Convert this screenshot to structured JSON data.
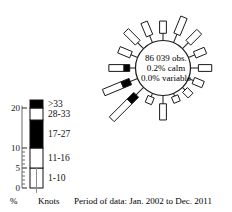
{
  "chart_data": {
    "type": "windrose",
    "title": "",
    "center_text": {
      "observations": "86 039 obs.",
      "calm": "0.2% calm",
      "variable": "0.0% variable"
    },
    "caption": "Period of data: Jan. 2002 to Dec. 2011",
    "axis": {
      "ylabel": "%",
      "ylim": [
        0,
        22
      ],
      "major_ticks": [
        0,
        5,
        10,
        20
      ],
      "major_tick_labels": [
        "0",
        "5",
        "10",
        "20"
      ],
      "minor_ticks": [
        1,
        2,
        3,
        4,
        6,
        7,
        8,
        9
      ]
    },
    "legend": {
      "units_label": "Knots",
      "bins": [
        {
          "label": "1-10",
          "fill": "#ffffff"
        },
        {
          "label": "11-16",
          "fill": "#ffffff"
        },
        {
          "label": "17-27",
          "fill": "#000000"
        },
        {
          "label": "28-33",
          "fill": "#ffffff"
        },
        {
          "label": ">33",
          "fill": "#000000"
        }
      ]
    },
    "directions": [
      "N",
      "NNE",
      "NE",
      "ENE",
      "E",
      "ESE",
      "SE",
      "SSE",
      "S",
      "SSW",
      "SW",
      "WSW",
      "W",
      "WNW",
      "NW",
      "NNW"
    ],
    "petals": [
      {
        "direction": "N",
        "angle_deg": 0,
        "total_percent": 5.4,
        "bins": [
          {
            "label": "1-10",
            "len": 3.4,
            "fill": "#ffffff"
          }
        ]
      },
      {
        "direction": "NNE",
        "angle_deg": 22.5,
        "total_percent": 7.6,
        "bins": [
          {
            "label": "1-10",
            "len": 5.1,
            "fill": "#ffffff"
          }
        ]
      },
      {
        "direction": "NE",
        "angle_deg": 45,
        "total_percent": 6.6,
        "bins": [
          {
            "label": "1-10",
            "len": 4.3,
            "fill": "#ffffff"
          }
        ]
      },
      {
        "direction": "ENE",
        "angle_deg": 67.5,
        "total_percent": 5.1,
        "bins": [
          {
            "label": "1-10",
            "len": 3.2,
            "fill": "#ffffff"
          }
        ]
      },
      {
        "direction": "E",
        "angle_deg": 90,
        "total_percent": 5.9,
        "bins": [
          {
            "label": "1-10",
            "len": 3.7,
            "fill": "#ffffff"
          }
        ]
      },
      {
        "direction": "ESE",
        "angle_deg": 112.5,
        "total_percent": 4.4,
        "bins": [
          {
            "label": "1-10",
            "len": 2.9,
            "fill": "#ffffff"
          }
        ]
      },
      {
        "direction": "SE",
        "angle_deg": 135,
        "total_percent": 3.2,
        "bins": [
          {
            "label": "1-10",
            "len": 2.2,
            "fill": "#ffffff"
          }
        ]
      },
      {
        "direction": "SSE",
        "angle_deg": 157.5,
        "total_percent": 2.6,
        "bins": [
          {
            "label": "1-10",
            "len": 1.8,
            "fill": "#ffffff"
          }
        ]
      },
      {
        "direction": "S",
        "angle_deg": 180,
        "total_percent": 6.8,
        "bins": [
          {
            "label": "1-10",
            "len": 4.5,
            "fill": "#ffffff"
          }
        ]
      },
      {
        "direction": "SSW",
        "angle_deg": 202.5,
        "total_percent": 3.0,
        "bins": [
          {
            "label": "1-10",
            "len": 2.0,
            "fill": "#ffffff"
          }
        ]
      },
      {
        "direction": "SW",
        "angle_deg": 225,
        "total_percent": 12.5,
        "bins": [
          {
            "label": "1-10",
            "len": 7.0,
            "fill": "#ffffff"
          },
          {
            "label": ">33",
            "len": 2.6,
            "fill": "#000000"
          }
        ]
      },
      {
        "direction": "WSW",
        "angle_deg": 247.5,
        "total_percent": 10.2,
        "bins": [
          {
            "label": "1-10",
            "len": 5.6,
            "fill": "#ffffff"
          },
          {
            "label": ">33",
            "len": 2.4,
            "fill": "#000000"
          }
        ]
      },
      {
        "direction": "W",
        "angle_deg": 270,
        "total_percent": 7.4,
        "bins": [
          {
            "label": "1-10",
            "len": 4.2,
            "fill": "#ffffff"
          },
          {
            "label": ">33",
            "len": 1.6,
            "fill": "#000000"
          }
        ]
      },
      {
        "direction": "WNW",
        "angle_deg": 292.5,
        "total_percent": 5.6,
        "bins": [
          {
            "label": "1-10",
            "len": 3.6,
            "fill": "#ffffff"
          }
        ]
      },
      {
        "direction": "NW",
        "angle_deg": 315,
        "total_percent": 6.9,
        "bins": [
          {
            "label": "1-10",
            "len": 4.6,
            "fill": "#ffffff"
          }
        ]
      },
      {
        "direction": "NNW",
        "angle_deg": 337.5,
        "total_percent": 6.1,
        "bins": [
          {
            "label": "1-10",
            "len": 4.0,
            "fill": "#ffffff"
          }
        ]
      }
    ]
  }
}
